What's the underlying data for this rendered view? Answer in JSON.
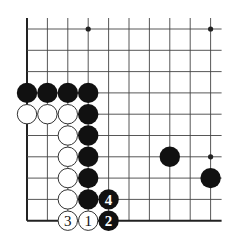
{
  "diagram": {
    "type": "go-board-fragment",
    "grid": {
      "columns": 10,
      "rows": 10,
      "origin_x": 27,
      "origin_y": 29,
      "spacing_x": 20.4,
      "spacing_y": 21.3,
      "right_extension": 11,
      "edges": {
        "left": true,
        "bottom": true,
        "top": false,
        "right": false
      }
    },
    "colors": {
      "line": "#444444",
      "edge": "#222222",
      "black_stone": "#111111",
      "white_stone": "#ffffff",
      "white_outline": "#333333"
    },
    "hoshi": [
      {
        "col": 3,
        "row": 0
      },
      {
        "col": 9,
        "row": 0
      },
      {
        "col": 9,
        "row": 6
      }
    ],
    "stones": [
      {
        "col": 0,
        "row": 3,
        "color": "black",
        "label": ""
      },
      {
        "col": 1,
        "row": 3,
        "color": "black",
        "label": ""
      },
      {
        "col": 2,
        "row": 3,
        "color": "black",
        "label": ""
      },
      {
        "col": 3,
        "row": 3,
        "color": "black",
        "label": ""
      },
      {
        "col": 0,
        "row": 4,
        "color": "white",
        "label": ""
      },
      {
        "col": 1,
        "row": 4,
        "color": "white",
        "label": ""
      },
      {
        "col": 2,
        "row": 4,
        "color": "white",
        "label": ""
      },
      {
        "col": 3,
        "row": 4,
        "color": "black",
        "label": ""
      },
      {
        "col": 2,
        "row": 5,
        "color": "white",
        "label": ""
      },
      {
        "col": 3,
        "row": 5,
        "color": "black",
        "label": ""
      },
      {
        "col": 2,
        "row": 6,
        "color": "white",
        "label": ""
      },
      {
        "col": 3,
        "row": 6,
        "color": "black",
        "label": ""
      },
      {
        "col": 2,
        "row": 7,
        "color": "white",
        "label": ""
      },
      {
        "col": 3,
        "row": 7,
        "color": "black",
        "label": ""
      },
      {
        "col": 2,
        "row": 8,
        "color": "white",
        "label": ""
      },
      {
        "col": 3,
        "row": 8,
        "color": "black",
        "label": ""
      },
      {
        "col": 4,
        "row": 8,
        "color": "black",
        "label": "4"
      },
      {
        "col": 2,
        "row": 9,
        "color": "white",
        "label": "3"
      },
      {
        "col": 3,
        "row": 9,
        "color": "white",
        "label": "1"
      },
      {
        "col": 4,
        "row": 9,
        "color": "black",
        "label": "2"
      },
      {
        "col": 7,
        "row": 6,
        "color": "black",
        "label": ""
      },
      {
        "col": 9,
        "row": 7,
        "color": "black",
        "label": ""
      }
    ]
  }
}
